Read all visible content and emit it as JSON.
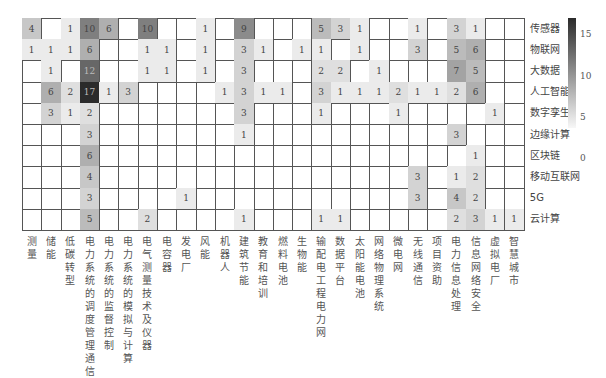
{
  "chart_data": {
    "type": "heatmap",
    "title": "",
    "xlabel": "",
    "ylabel": "",
    "rows": [
      "传感器",
      "物联网",
      "大数据",
      "人工智能",
      "数字孪生",
      "边缘计算",
      "区块链",
      "移动互联网",
      "5G",
      "云计算"
    ],
    "columns": [
      "测量",
      "储能",
      "低碳转型",
      "电力系统的调度管理通信",
      "电力系统的监督控制",
      "电力系统的模拟与计算",
      "电气测量技术及仪器",
      "电容器",
      "发电厂",
      "风能",
      "机器人",
      "建筑节能",
      "教育和培训",
      "燃料电池",
      "生物能",
      "输配电工程电力网",
      "数据平台",
      "太阳能电池",
      "网络物理系统",
      "微电网",
      "无线通信",
      "项目资助",
      "电力信息处理",
      "信息网络安全",
      "虚拟电厂",
      "智慧城市"
    ],
    "values": [
      [
        4,
        null,
        1,
        10,
        6,
        null,
        10,
        null,
        null,
        1,
        null,
        9,
        null,
        null,
        null,
        5,
        3,
        1,
        null,
        null,
        1,
        null,
        3,
        1,
        null,
        null
      ],
      [
        1,
        1,
        1,
        6,
        null,
        null,
        1,
        1,
        null,
        1,
        null,
        3,
        1,
        null,
        1,
        1,
        null,
        1,
        null,
        null,
        3,
        null,
        5,
        6,
        null,
        null
      ],
      [
        null,
        1,
        null,
        12,
        null,
        null,
        1,
        1,
        null,
        1,
        null,
        3,
        null,
        null,
        null,
        2,
        2,
        null,
        1,
        null,
        null,
        null,
        7,
        5,
        null,
        null
      ],
      [
        null,
        6,
        2,
        17,
        1,
        3,
        null,
        null,
        null,
        null,
        1,
        3,
        1,
        1,
        null,
        3,
        1,
        1,
        1,
        2,
        1,
        1,
        2,
        6,
        null,
        null
      ],
      [
        null,
        3,
        1,
        2,
        null,
        null,
        null,
        null,
        null,
        null,
        null,
        3,
        null,
        null,
        null,
        1,
        null,
        null,
        null,
        1,
        null,
        null,
        null,
        null,
        1,
        null
      ],
      [
        null,
        null,
        null,
        3,
        null,
        null,
        null,
        null,
        null,
        null,
        null,
        1,
        null,
        null,
        null,
        null,
        null,
        null,
        null,
        null,
        null,
        null,
        3,
        null,
        null,
        null
      ],
      [
        null,
        null,
        null,
        6,
        null,
        null,
        null,
        null,
        null,
        null,
        null,
        null,
        null,
        null,
        null,
        null,
        null,
        null,
        null,
        null,
        null,
        null,
        null,
        1,
        null,
        null
      ],
      [
        null,
        null,
        null,
        4,
        null,
        null,
        null,
        null,
        null,
        null,
        null,
        null,
        null,
        null,
        null,
        null,
        null,
        null,
        null,
        null,
        3,
        null,
        1,
        2,
        null,
        null
      ],
      [
        null,
        null,
        null,
        3,
        null,
        null,
        null,
        null,
        1,
        null,
        null,
        null,
        null,
        null,
        null,
        null,
        null,
        null,
        null,
        null,
        3,
        null,
        4,
        2,
        null,
        null
      ],
      [
        null,
        null,
        null,
        5,
        null,
        null,
        2,
        null,
        null,
        null,
        null,
        1,
        null,
        null,
        null,
        1,
        1,
        null,
        null,
        null,
        null,
        null,
        2,
        3,
        1,
        1
      ]
    ],
    "colorbar": {
      "min": 0,
      "max": 17,
      "ticks": [
        0,
        5,
        10,
        15
      ],
      "colormap": "greys"
    },
    "grid": true,
    "legend_position": "right"
  },
  "colors": {
    "low": "#f7f7f7",
    "high": "#2b2b2b",
    "grid_line": "#555555"
  }
}
